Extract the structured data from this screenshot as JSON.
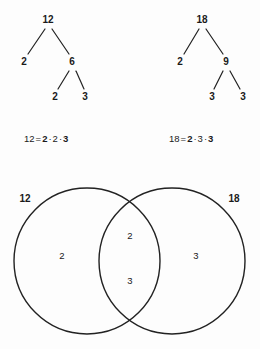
{
  "background_color": "#fdfdfd",
  "ink_color": "#1a1a1a",
  "stroke_color": "#222222",
  "factor_trees": [
    {
      "name": "factor-tree-12",
      "root": {
        "label": "12",
        "x": 48,
        "y": 20
      },
      "nodes": [
        {
          "label": "2",
          "x": 24,
          "y": 62
        },
        {
          "label": "6",
          "x": 72,
          "y": 62
        },
        {
          "label": "2",
          "x": 55,
          "y": 97
        },
        {
          "label": "3",
          "x": 85,
          "y": 97
        }
      ],
      "edges": [
        {
          "x1": 45,
          "y1": 29,
          "x2": 28,
          "y2": 54
        },
        {
          "x1": 52,
          "y1": 29,
          "x2": 69,
          "y2": 54
        },
        {
          "x1": 69,
          "y1": 71,
          "x2": 58,
          "y2": 89
        },
        {
          "x1": 76,
          "y1": 71,
          "x2": 84,
          "y2": 89
        }
      ]
    },
    {
      "name": "factor-tree-18",
      "root": {
        "label": "18",
        "x": 202,
        "y": 20
      },
      "nodes": [
        {
          "label": "2",
          "x": 180,
          "y": 62
        },
        {
          "label": "9",
          "x": 226,
          "y": 62
        },
        {
          "label": "3",
          "x": 212,
          "y": 97
        },
        {
          "label": "3",
          "x": 243,
          "y": 97
        }
      ],
      "edges": [
        {
          "x1": 199,
          "y1": 29,
          "x2": 184,
          "y2": 54
        },
        {
          "x1": 206,
          "y1": 29,
          "x2": 223,
          "y2": 54
        },
        {
          "x1": 223,
          "y1": 71,
          "x2": 214,
          "y2": 89
        },
        {
          "x1": 230,
          "y1": 71,
          "x2": 240,
          "y2": 89
        }
      ]
    }
  ],
  "equations": [
    {
      "name": "equation-12",
      "x": 24,
      "y": 139,
      "lhs": "12",
      "equals": "=",
      "factors": [
        {
          "value": "2",
          "bold": true
        },
        {
          "value": "2",
          "bold": false
        },
        {
          "value": "3",
          "bold": true
        }
      ],
      "separator": "·"
    },
    {
      "name": "equation-18",
      "x": 169,
      "y": 139,
      "lhs": "18",
      "equals": "=",
      "factors": [
        {
          "value": "2",
          "bold": true
        },
        {
          "value": "3",
          "bold": false
        },
        {
          "value": "3",
          "bold": true
        }
      ],
      "separator": "·"
    }
  ],
  "venn": {
    "name": "venn-diagram",
    "left_circle": {
      "cx": 87,
      "cy": 261,
      "r": 73
    },
    "right_circle": {
      "cx": 172,
      "cy": 261,
      "r": 73
    },
    "labels": {
      "left": {
        "text": "12",
        "x": 25,
        "y": 199
      },
      "right": {
        "text": "18",
        "x": 234,
        "y": 199
      }
    },
    "items": {
      "left_only": [
        {
          "text": "2",
          "x": 62,
          "y": 256
        }
      ],
      "intersection": [
        {
          "text": "2",
          "x": 130,
          "y": 236
        },
        {
          "text": "3",
          "x": 130,
          "y": 281
        }
      ],
      "right_only": [
        {
          "text": "3",
          "x": 196,
          "y": 256
        }
      ]
    }
  }
}
